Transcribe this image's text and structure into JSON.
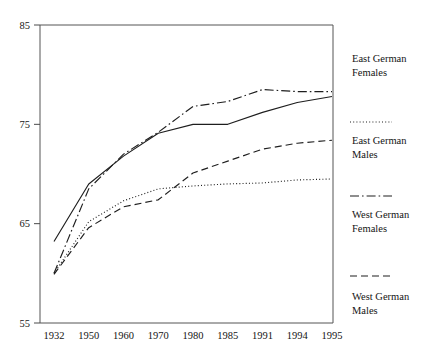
{
  "chart_data": {
    "type": "line",
    "title": "",
    "subtitle": "",
    "xlabel": "",
    "ylabel": "",
    "categories": [
      "1932",
      "1950",
      "1960",
      "1970",
      "1980",
      "1985",
      "1991",
      "1994",
      "1995"
    ],
    "ylim": [
      55,
      85
    ],
    "yticks": [
      55,
      65,
      75,
      85
    ],
    "ytick_labels": [
      "55",
      "65",
      "75",
      "85"
    ],
    "grid": false,
    "legend_position": "right",
    "series": [
      {
        "name": "East German Females",
        "style": "solid",
        "values": [
          63.2,
          69.0,
          71.8,
          74.1,
          75.0,
          75.0,
          76.2,
          77.2,
          77.8
        ]
      },
      {
        "name": "East German Males",
        "style": "dotted",
        "values": [
          60.0,
          65.2,
          67.3,
          68.5,
          68.8,
          69.0,
          69.1,
          69.4,
          69.5
        ]
      },
      {
        "name": "West German Females",
        "style": "dash-dot",
        "values": [
          60.0,
          68.5,
          72.0,
          74.2,
          76.8,
          77.3,
          78.5,
          78.3,
          78.3
        ]
      },
      {
        "name": "West German Males",
        "style": "dashed",
        "values": [
          59.9,
          64.6,
          66.7,
          67.4,
          70.1,
          71.3,
          72.5,
          73.1,
          73.4
        ]
      }
    ]
  },
  "legend": {
    "entries": [
      {
        "label_line1": "East German",
        "label_line2": "Females",
        "style": "solid"
      },
      {
        "label_line1": "East German",
        "label_line2": "Males",
        "style": "dotted"
      },
      {
        "label_line1": "West German",
        "label_line2": "Females",
        "style": "dash-dot"
      },
      {
        "label_line1": "West German",
        "label_line2": "Males",
        "style": "dashed"
      }
    ]
  }
}
